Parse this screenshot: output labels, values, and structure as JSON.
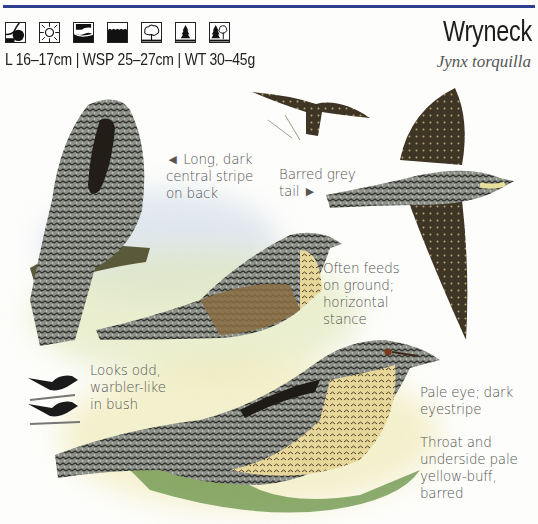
{
  "header": {
    "title": "Wryneck",
    "scientific_name": "Jynx torquilla",
    "stats": "L 16–17cm | WSP 25–27cm | WT 30–45g",
    "habitat_icons": [
      {
        "name": "hill-slope-icon"
      },
      {
        "name": "sun-open-icon"
      },
      {
        "name": "coast-wave-icon"
      },
      {
        "name": "grassland-icon"
      },
      {
        "name": "deciduous-tree-icon"
      },
      {
        "name": "conifer-tree-icon"
      },
      {
        "name": "mixed-woodland-icon"
      }
    ],
    "rule_color": "#2f3f8f"
  },
  "annotations": {
    "back_stripe": "◄ Long, dark\ncentral stripe\non back",
    "tail": "Barred grey\ntail ►",
    "ground": "Often feeds\non ground;\nhorizontal\nstance",
    "bush": "Looks odd,\nwarbler-like\nin bush",
    "eye": "Pale eye; dark\neyestripe",
    "throat": "Throat and\nunderside pale\nyellow-buff,\nbarred"
  }
}
